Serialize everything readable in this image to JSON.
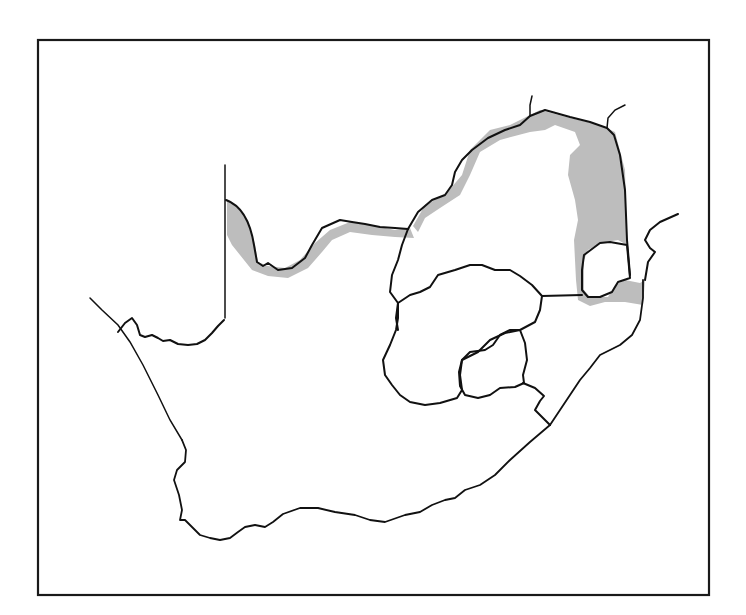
{
  "map": {
    "subject": "Southern Africa outline map",
    "frame": {
      "x": 38,
      "y": 40,
      "width": 671,
      "height": 555
    },
    "colors": {
      "background": "#ffffff",
      "line": "#111111",
      "shaded_region": "#bdbdbd"
    },
    "legend": [],
    "labels": [],
    "shaded_regions": [
      {
        "name": "northwest-border-strip",
        "d": "M227,199 C240,205 250,220 255,245 L258,262 L268,266 L285,268 L300,260 L315,243 L330,230 L350,222 L375,226 L395,230 L410,228 L414,238 L395,237 L372,235 L350,232 L332,240 L322,252 L308,268 L288,278 L268,276 L252,270 L240,255 L232,245 L227,235 Z"
      },
      {
        "name": "northeast-border-strip",
        "d": "M413,226 L425,205 L445,195 L462,175 L470,150 L490,130 L510,125 L530,115 L540,110 L570,118 L600,125 L615,132 L625,170 L627,245 L618,240 L600,243 L588,250 L584,260 L584,290 L590,297 L608,297 L615,285 L625,280 L640,283 L645,280 L643,305 L625,302 L605,302 L590,306 L578,300 L576,280 L574,240 L578,220 L575,200 L568,175 L570,155 L580,145 L575,132 L555,125 L545,130 L530,132 L500,140 L480,152 L470,175 L460,195 L440,208 L425,218 L418,232 Z"
      }
    ],
    "borders": [
      {
        "name": "namibia-border-vertical",
        "d": "M225,165 L225,318"
      },
      {
        "name": "north-river-border",
        "d": "M226,200 C240,205 250,220 254,245 L257,262 L263,266 L268,263 L278,270 L292,268 L305,258 L312,245 L322,228 L340,220 L352,222 L365,224 L380,227 L395,228 L408,229"
      },
      {
        "name": "northeast-border",
        "d": "M408,229 L418,212 L432,200 L445,195 L452,185 L455,172 L462,160 L472,150 L488,138 L505,130 L520,125 L530,116 L545,110 L570,117 L590,122 L607,128 L614,135 L620,155 L625,190 L627,240 L630,275"
      },
      {
        "name": "northeast-stub-1",
        "d": "M530,116 L530,105 L532,96"
      },
      {
        "name": "northeast-stub-2",
        "d": "M607,128 L608,118 L615,110 L625,105"
      },
      {
        "name": "mozambique-coast-border",
        "d": "M645,280 L648,262 L655,252 L650,248 L645,240 L650,230 L660,222 L678,214"
      },
      {
        "name": "inner-region-west-border",
        "d": "M408,229 L402,245 L398,260 L392,275 L390,292 L398,303 L396,318 L398,330"
      },
      {
        "name": "swaziland-outline",
        "d": "M584,255 L600,243 L610,242 L627,245 L630,278 L618,282 L612,292 L600,297 L588,297 L582,290 L582,270 Z"
      },
      {
        "name": "central-east-border",
        "d": "M542,296 L582,295"
      },
      {
        "name": "central-region-outline",
        "d": "M398,303 L410,295 L420,292 L430,287 L438,275 L455,270 L470,265 L482,265 L495,270 L510,270 L520,276 L532,285 L542,296 L540,310 L535,322 L520,330 L510,330 L500,335 L493,345 L485,350 L470,352 L462,360 L460,375 L462,390 L457,398 L440,403 L425,405 L410,402 L400,395 L392,385 L385,375 L383,360 L390,345 L396,330 L398,318 Z"
      },
      {
        "name": "lesotho-outline",
        "d": "M462,360 L478,352 L490,340 L505,333 L520,330 L525,343 L527,360 L523,375 L524,383 L515,387 L500,388 L490,395 L478,398 L465,395 L460,386 L459,372 Z"
      },
      {
        "name": "southeast-border",
        "d": "M523,383 L535,388 L544,396 L540,401 L535,410 L545,420 L550,425"
      },
      {
        "name": "east-coast",
        "d": "M643,280 L643,298 L640,320 L632,335 L620,345 L610,350 L600,355 L590,368 L580,380 L570,395 L560,410 L550,425"
      },
      {
        "name": "south-coast",
        "d": "M550,425 L530,442 L510,460 L495,475 L480,485 L465,490 L455,498 L445,500 L432,505 L420,512 L405,515 L385,522 L370,520 L355,515 L335,512 L318,508 L300,508 L283,514 L273,522 L265,527 L255,525 L245,527 L238,532 L230,538 L220,540 L210,538 L200,535 L193,528 L185,520 L180,520 L182,510 L179,495 L174,480 L177,470 L185,462 L186,450 L182,440"
      },
      {
        "name": "west-coast",
        "d": "M182,440 L170,420 L158,395 L143,365 L130,342 L118,325 L102,310 L90,298"
      },
      {
        "name": "orange-river-mouth-border",
        "d": "M118,332 L125,323 L132,318 L137,325 L140,335 L145,337 L152,335 L158,338 L163,341 L170,340 L178,344 L188,345 L197,344 L205,340 L212,333 L218,326 L224,320"
      }
    ]
  }
}
